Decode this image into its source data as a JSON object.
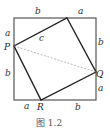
{
  "figure": {
    "caption": "图 1.2",
    "colors": {
      "outer_square": "#555555",
      "inner_square": "#222222",
      "dashed_line": "#999999",
      "label": "#333333"
    },
    "outer_square": {
      "x1": 14,
      "y1": 18,
      "x2": 96,
      "y2": 100
    },
    "inner_square": {
      "top": {
        "x": 67,
        "y": 18
      },
      "right": {
        "x": 96,
        "y": 72
      },
      "bottom": {
        "x": 41,
        "y": 100
      },
      "left": {
        "x": 14,
        "y": 46
      }
    },
    "points": {
      "P": {
        "label": "P",
        "x": 14,
        "y": 46
      },
      "Q": {
        "label": "Q",
        "x": 96,
        "y": 72
      },
      "R": {
        "label": "R",
        "x": 41,
        "y": 100
      }
    },
    "segment_labels": {
      "top_left": "b",
      "top_right": "a",
      "left_top": "a",
      "left_bottom": "b",
      "right_top": "b",
      "right_bottom": "a",
      "bottom_left": "a",
      "bottom_right": "b",
      "hypotenuse": "c"
    },
    "dashed_segment": [
      "P",
      "Q"
    ]
  }
}
